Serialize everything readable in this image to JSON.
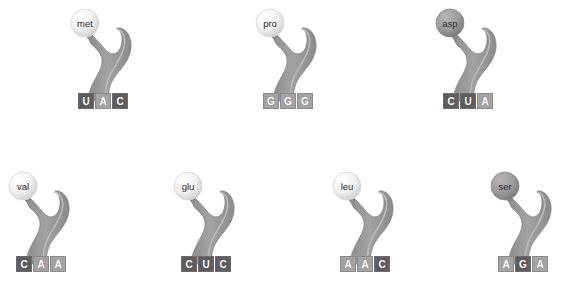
{
  "figure": {
    "background_color": "#ffffff",
    "body_color": "#9b9b9b",
    "box_dark_color": "#5d5d5d",
    "box_light_color": "#a3a3a3",
    "box_text_color": "#ffffff",
    "label_text_color": "#2b2b2b"
  },
  "trnas": [
    {
      "amino_acid": "met",
      "circle_shade": "light",
      "x": 60,
      "y": 5,
      "codon": [
        {
          "base": "U",
          "shade": "dark"
        },
        {
          "base": "A",
          "shade": "light"
        },
        {
          "base": "C",
          "shade": "dark"
        }
      ]
    },
    {
      "amino_acid": "pro",
      "circle_shade": "light",
      "x": 245,
      "y": 5,
      "codon": [
        {
          "base": "G",
          "shade": "light"
        },
        {
          "base": "G",
          "shade": "light"
        },
        {
          "base": "G",
          "shade": "light"
        }
      ]
    },
    {
      "amino_acid": "asp",
      "circle_shade": "dark",
      "x": 425,
      "y": 5,
      "codon": [
        {
          "base": "C",
          "shade": "dark"
        },
        {
          "base": "U",
          "shade": "dark"
        },
        {
          "base": "A",
          "shade": "light"
        }
      ]
    },
    {
      "amino_acid": "val",
      "circle_shade": "light",
      "x": -2,
      "y": 168,
      "codon": [
        {
          "base": "C",
          "shade": "dark"
        },
        {
          "base": "A",
          "shade": "light"
        },
        {
          "base": "A",
          "shade": "light"
        }
      ]
    },
    {
      "amino_acid": "glu",
      "circle_shade": "light",
      "x": 163,
      "y": 168,
      "codon": [
        {
          "base": "C",
          "shade": "dark"
        },
        {
          "base": "U",
          "shade": "dark"
        },
        {
          "base": "C",
          "shade": "dark"
        }
      ]
    },
    {
      "amino_acid": "leu",
      "circle_shade": "light",
      "x": 322,
      "y": 168,
      "codon": [
        {
          "base": "A",
          "shade": "light"
        },
        {
          "base": "A",
          "shade": "light"
        },
        {
          "base": "C",
          "shade": "dark"
        }
      ]
    },
    {
      "amino_acid": "ser",
      "circle_shade": "dark",
      "x": 480,
      "y": 168,
      "codon": [
        {
          "base": "A",
          "shade": "light"
        },
        {
          "base": "G",
          "shade": "dark"
        },
        {
          "base": "A",
          "shade": "light"
        }
      ]
    }
  ]
}
